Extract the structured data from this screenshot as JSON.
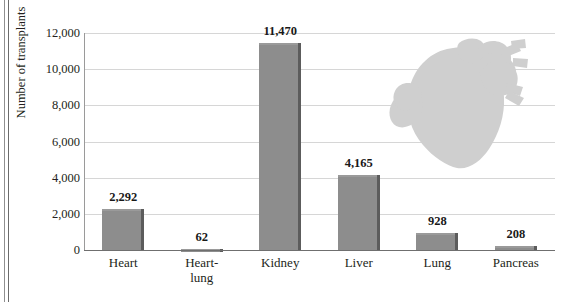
{
  "chart_data": {
    "type": "bar",
    "title": "",
    "xlabel": "",
    "ylabel": "Number of transplants",
    "categories": [
      "Heart",
      "Heart-\nlung",
      "Kidney",
      "Liver",
      "Lung",
      "Pancreas"
    ],
    "values": [
      2292,
      62,
      11470,
      4165,
      928,
      208
    ],
    "value_labels": [
      "2,292",
      "62",
      "11,470",
      "4,165",
      "928",
      "208"
    ],
    "ylim": [
      0,
      12000
    ],
    "yticks": [
      0,
      2000,
      4000,
      6000,
      8000,
      10000,
      12000
    ],
    "ytick_labels": [
      "0",
      "2,000",
      "4,000",
      "6,000",
      "8,000",
      "10,000",
      "12,000"
    ],
    "grid": true,
    "legend": "none",
    "bar_color": "#8d8d8d",
    "bar_edge_color": "#5c5c5c",
    "gridline_color": "#d6d6d6",
    "axis_color": "#6f6f6f",
    "text_color": "#231f20"
  },
  "decoration": {
    "heart_icon_name": "anatomical-heart-illustration",
    "heart_color": "#cfcfcf"
  }
}
